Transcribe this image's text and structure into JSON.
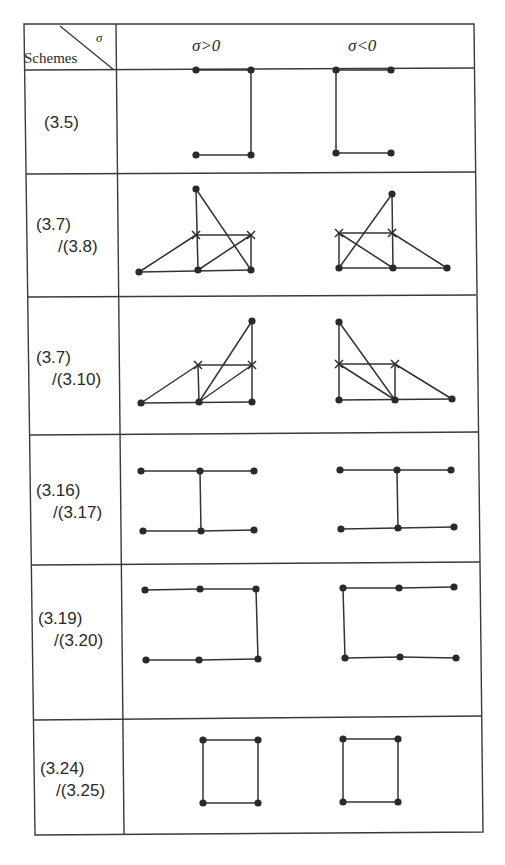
{
  "table": {
    "corner": {
      "row_header": "Schemes",
      "col_header": "σ"
    },
    "columns": [
      "σ>0",
      "σ<0"
    ],
    "rows": [
      {
        "scheme_line1": "(3.5)",
        "scheme_line2": "",
        "pos": {
          "dots": [
            [
              196,
              70
            ],
            [
              251,
              70
            ],
            [
              196,
              155
            ],
            [
              251,
              155
            ]
          ],
          "crosses": [],
          "edges": [
            [
              0,
              1
            ],
            [
              1,
              3
            ],
            [
              2,
              3
            ]
          ]
        },
        "neg": {
          "dots": [
            [
              336,
              70
            ],
            [
              391,
              70
            ],
            [
              336,
              153
            ],
            [
              391,
              153
            ]
          ],
          "crosses": [],
          "edges": [
            [
              0,
              1
            ],
            [
              0,
              2
            ],
            [
              2,
              3
            ]
          ]
        }
      },
      {
        "scheme_line1": "(3.7)",
        "scheme_line2": "/(3.8)",
        "pos": {
          "dots": [
            [
              196,
              189
            ],
            [
              139,
              272
            ],
            [
              198,
              270
            ],
            [
              251,
              270
            ]
          ],
          "crosses": [
            [
              196,
              235
            ],
            [
              251,
              235
            ]
          ],
          "edges": [
            [
              0,
              3
            ],
            [
              0,
              2
            ],
            [
              1,
              "x0"
            ],
            [
              "x0",
              "x1"
            ],
            [
              2,
              "x1"
            ],
            [
              "x1",
              3
            ],
            [
              1,
              3
            ]
          ]
        },
        "neg": {
          "dots": [
            [
              392,
              194
            ],
            [
              339,
              268
            ],
            [
              393,
              268
            ],
            [
              447,
              268
            ]
          ],
          "crosses": [
            [
              339,
              233
            ],
            [
              392,
              233
            ]
          ],
          "edges": [
            [
              1,
              0
            ],
            [
              0,
              2
            ],
            [
              "x0",
              "x1"
            ],
            [
              "x0",
              1
            ],
            [
              "x0",
              2
            ],
            [
              "x1",
              3
            ],
            [
              1,
              3
            ]
          ]
        }
      },
      {
        "scheme_line1": "(3.7)",
        "scheme_line2": "/(3.10)",
        "pos": {
          "dots": [
            [
              252,
              321
            ],
            [
              141,
              403
            ],
            [
              199,
              402
            ],
            [
              252,
              402
            ]
          ],
          "crosses": [
            [
              198,
              365
            ],
            [
              252,
              365
            ]
          ],
          "edges": [
            [
              1,
              "x0"
            ],
            [
              "x0",
              "x1"
            ],
            [
              "x0",
              2
            ],
            [
              2,
              0
            ],
            [
              2,
              "x1"
            ],
            [
              0,
              3
            ],
            [
              1,
              3
            ]
          ]
        },
        "neg": {
          "dots": [
            [
              339,
              322
            ],
            [
              339,
              400
            ],
            [
              395,
              400
            ],
            [
              452,
              399
            ]
          ],
          "crosses": [
            [
              339,
              364
            ],
            [
              395,
              364
            ]
          ],
          "edges": [
            [
              0,
              1
            ],
            [
              0,
              2
            ],
            [
              "x0",
              "x1"
            ],
            [
              "x0",
              2
            ],
            [
              "x1",
              2
            ],
            [
              "x1",
              3
            ],
            [
              1,
              3
            ]
          ]
        }
      },
      {
        "scheme_line1": "(3.16)",
        "scheme_line2": "/(3.17)",
        "pos": {
          "dots": [
            [
              141,
              471
            ],
            [
              200,
              471
            ],
            [
              254,
              471
            ],
            [
              143,
              531
            ],
            [
              201,
              531
            ],
            [
              254,
              530
            ]
          ],
          "crosses": [],
          "edges": [
            [
              0,
              1
            ],
            [
              1,
              2
            ],
            [
              1,
              4
            ],
            [
              3,
              4
            ],
            [
              4,
              5
            ]
          ]
        },
        "neg": {
          "dots": [
            [
              340,
              470
            ],
            [
              397,
              470
            ],
            [
              451,
              470
            ],
            [
              341,
              529
            ],
            [
              398,
              528
            ],
            [
              454,
              527
            ]
          ],
          "crosses": [],
          "edges": [
            [
              0,
              1
            ],
            [
              1,
              2
            ],
            [
              1,
              4
            ],
            [
              3,
              4
            ],
            [
              4,
              5
            ]
          ]
        }
      },
      {
        "scheme_line1": "(3.19)",
        "scheme_line2": "/(3.20)",
        "pos": {
          "dots": [
            [
              145,
              590
            ],
            [
              200,
              589
            ],
            [
              256,
              589
            ],
            [
              146,
              660
            ],
            [
              199,
              660
            ],
            [
              258,
              659
            ]
          ],
          "crosses": [],
          "edges": [
            [
              0,
              1
            ],
            [
              1,
              2
            ],
            [
              2,
              5
            ],
            [
              3,
              4
            ],
            [
              4,
              5
            ]
          ]
        },
        "neg": {
          "dots": [
            [
              343,
              588
            ],
            [
              399,
              588
            ],
            [
              454,
              587
            ],
            [
              345,
              658
            ],
            [
              400,
              657
            ],
            [
              456,
              658
            ]
          ],
          "crosses": [],
          "edges": [
            [
              0,
              1
            ],
            [
              1,
              2
            ],
            [
              0,
              3
            ],
            [
              3,
              4
            ],
            [
              4,
              5
            ]
          ]
        }
      },
      {
        "scheme_line1": "(3.24)",
        "scheme_line2": "/(3.25)",
        "pos": {
          "dots": [
            [
              203,
              740
            ],
            [
              258,
              740
            ],
            [
              203,
              803
            ],
            [
              258,
              803
            ]
          ],
          "crosses": [],
          "edges": [
            [
              0,
              1
            ],
            [
              1,
              3
            ],
            [
              3,
              2
            ],
            [
              2,
              0
            ]
          ]
        },
        "neg": {
          "dots": [
            [
              343,
              739
            ],
            [
              398,
              739
            ],
            [
              343,
              802
            ],
            [
              398,
              802
            ]
          ],
          "crosses": [],
          "edges": [
            [
              0,
              1
            ],
            [
              1,
              3
            ],
            [
              3,
              2
            ],
            [
              2,
              0
            ]
          ]
        }
      }
    ]
  }
}
